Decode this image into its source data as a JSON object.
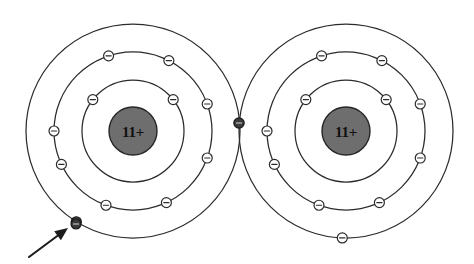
{
  "figure": {
    "background_color": "#ffffff",
    "width": 474,
    "height": 264,
    "line_color": "#2b2b2b",
    "nucleus_fill": "#6e6e6e",
    "highlight_fill": "#3a3a3a"
  },
  "atoms": [
    {
      "id": "left-atom",
      "nucleus_label": "11+",
      "center": {
        "x": 133,
        "y": 131
      },
      "shells": [
        {
          "name": "shell-1",
          "radius": 51,
          "electron_count": 2
        },
        {
          "name": "shell-2",
          "radius": 79,
          "electron_count": 8
        },
        {
          "name": "shell-3",
          "radius": 107,
          "electron_count": 1
        }
      ],
      "electrons": [
        {
          "shell": 1,
          "angle_deg": 38,
          "style": "open"
        },
        {
          "shell": 1,
          "angle_deg": 142,
          "style": "open"
        },
        {
          "shell": 2,
          "angle_deg": 20,
          "style": "open"
        },
        {
          "shell": 2,
          "angle_deg": 63,
          "style": "open"
        },
        {
          "shell": 2,
          "angle_deg": 108,
          "style": "open"
        },
        {
          "shell": 2,
          "angle_deg": 180,
          "style": "open"
        },
        {
          "shell": 2,
          "angle_deg": 205,
          "style": "open"
        },
        {
          "shell": 2,
          "angle_deg": 250,
          "style": "open"
        },
        {
          "shell": 2,
          "angle_deg": 295,
          "style": "open"
        },
        {
          "shell": 2,
          "angle_deg": 340,
          "style": "open"
        },
        {
          "shell": 3,
          "angle_deg": 238,
          "style": "filled"
        },
        {
          "shell": 3,
          "angle_deg": 2,
          "style": "filled-shared"
        }
      ]
    },
    {
      "id": "right-atom",
      "nucleus_label": "11+",
      "center": {
        "x": 346,
        "y": 131
      },
      "shells": [
        {
          "name": "shell-1",
          "radius": 51,
          "electron_count": 2
        },
        {
          "name": "shell-2",
          "radius": 79,
          "electron_count": 8
        },
        {
          "name": "shell-3",
          "radius": 107,
          "electron_count": 1
        }
      ],
      "electrons": [
        {
          "shell": 1,
          "angle_deg": 38,
          "style": "open"
        },
        {
          "shell": 1,
          "angle_deg": 142,
          "style": "open"
        },
        {
          "shell": 2,
          "angle_deg": 20,
          "style": "open"
        },
        {
          "shell": 2,
          "angle_deg": 63,
          "style": "open"
        },
        {
          "shell": 2,
          "angle_deg": 108,
          "style": "open"
        },
        {
          "shell": 2,
          "angle_deg": 180,
          "style": "open"
        },
        {
          "shell": 2,
          "angle_deg": 205,
          "style": "open"
        },
        {
          "shell": 2,
          "angle_deg": 250,
          "style": "open"
        },
        {
          "shell": 2,
          "angle_deg": 295,
          "style": "open"
        },
        {
          "shell": 2,
          "angle_deg": 340,
          "style": "open"
        },
        {
          "shell": 3,
          "angle_deg": 268,
          "style": "open"
        }
      ]
    }
  ],
  "shared_electron": {
    "name": "shared-electron",
    "x": 239,
    "y": 123,
    "radius": 5.2,
    "style": "filled"
  },
  "highlighted_electron": {
    "name": "highlighted-valence-electron",
    "x": 76,
    "y": 224,
    "radius": 5.0,
    "style": "filled"
  },
  "pointer": {
    "name": "annotation-arrow",
    "tail": {
      "x": 29,
      "y": 257
    },
    "tip": {
      "x": 68,
      "y": 228
    }
  }
}
